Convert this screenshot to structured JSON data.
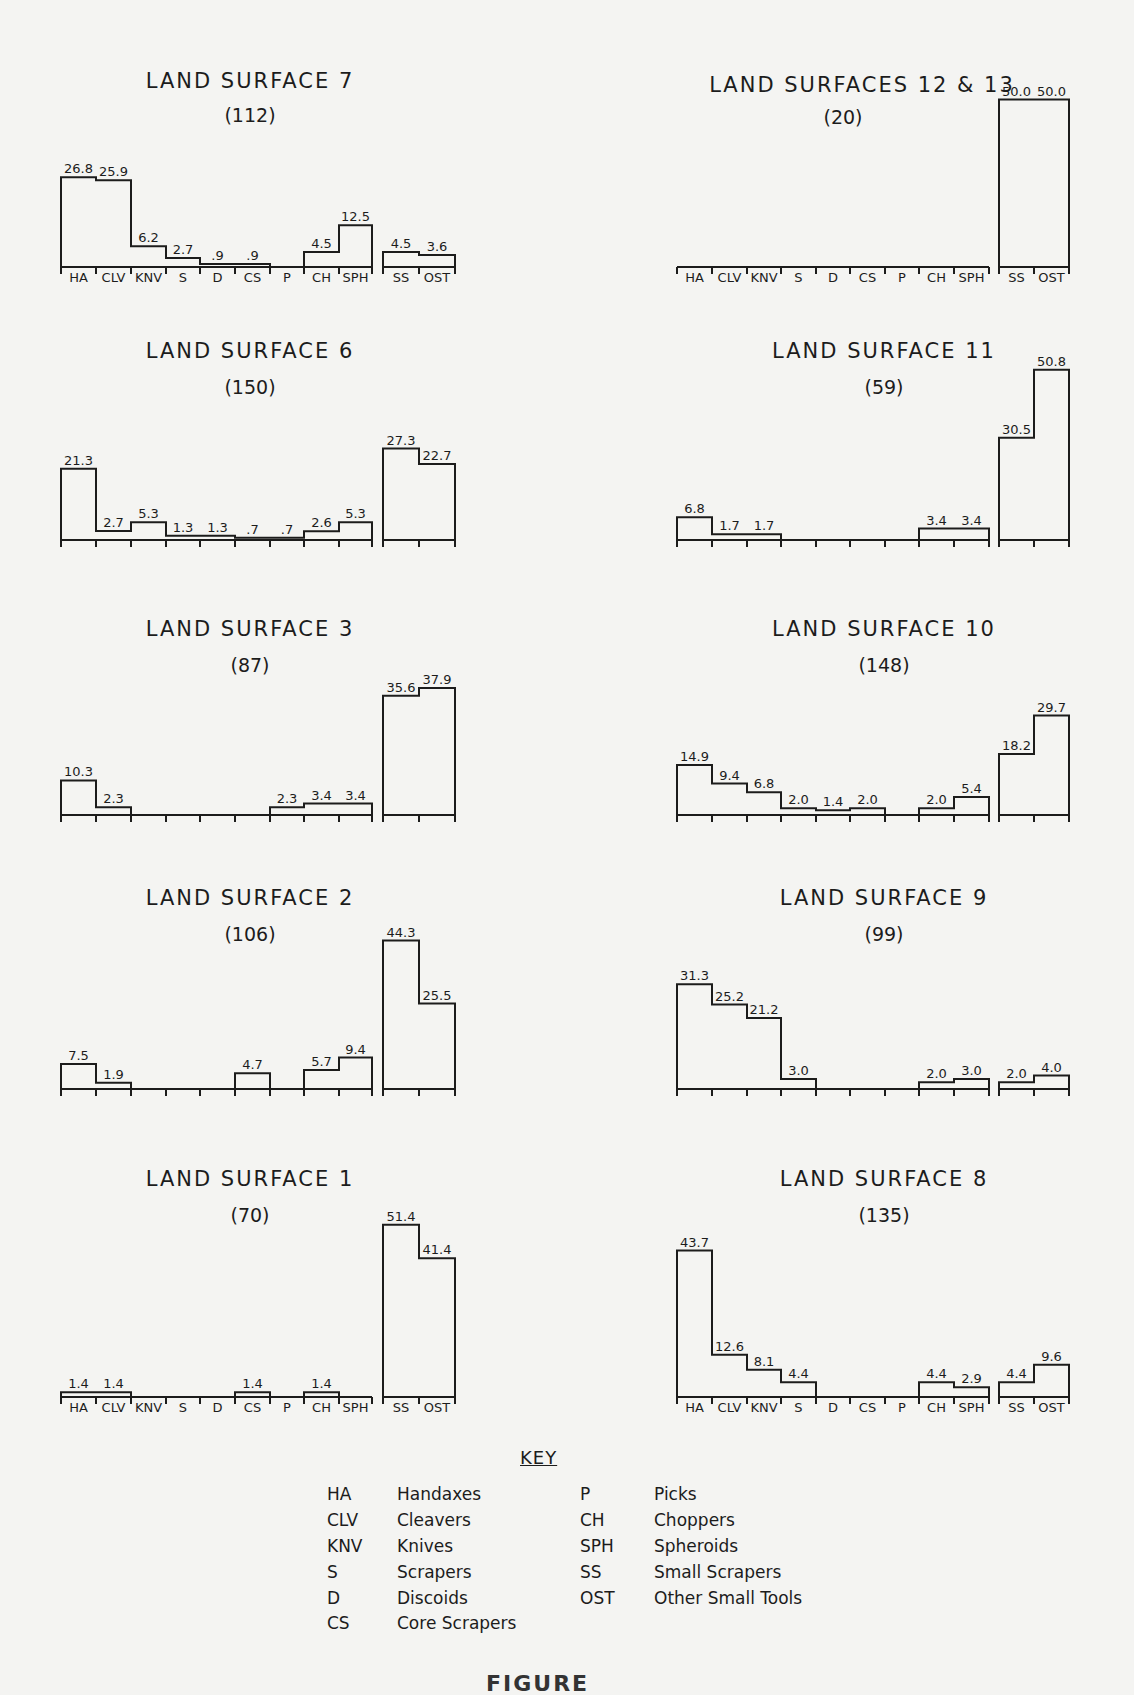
{
  "figure_caption": "FIGURE",
  "categories": [
    "HA",
    "CLV",
    "KNV",
    "S",
    "D",
    "CS",
    "P",
    "CH",
    "SPH",
    "SS",
    "OST"
  ],
  "key": {
    "title": "KEY",
    "left": [
      {
        "abbr": "HA",
        "name": "Handaxes"
      },
      {
        "abbr": "CLV",
        "name": "Cleavers"
      },
      {
        "abbr": "KNV",
        "name": "Knives"
      },
      {
        "abbr": "S",
        "name": "Scrapers"
      },
      {
        "abbr": "D",
        "name": "Discoids"
      },
      {
        "abbr": "CS",
        "name": "Core Scrapers"
      }
    ],
    "right": [
      {
        "abbr": "P",
        "name": "Picks"
      },
      {
        "abbr": "CH",
        "name": "Choppers"
      },
      {
        "abbr": "SPH",
        "name": "Spheroids"
      },
      {
        "abbr": "SS",
        "name": "Small Scrapers"
      },
      {
        "abbr": "OST",
        "name": "Other Small Tools"
      }
    ]
  },
  "chart_data": [
    {
      "type": "bar",
      "title": "LAND SURFACE 7",
      "count": "(112)",
      "column": "left",
      "show_labels": true,
      "categories": [
        "HA",
        "CLV",
        "KNV",
        "S",
        "D",
        "CS",
        "P",
        "CH",
        "SPH",
        "SS",
        "OST"
      ],
      "values": [
        26.8,
        25.9,
        6.2,
        2.7,
        0.9,
        0.9,
        0,
        4.5,
        12.5,
        4.5,
        3.6
      ],
      "value_labels": [
        "26.8",
        "25.9",
        "6.2",
        "2.7",
        ".9",
        ".9",
        "",
        "4.5",
        "12.5",
        "4.5",
        "3.6"
      ],
      "xlabel": "",
      "ylabel": "Percent",
      "grid": false
    },
    {
      "type": "bar",
      "title": "LAND SURFACE 6",
      "count": "(150)",
      "column": "left",
      "show_labels": false,
      "categories": [
        "HA",
        "CLV",
        "KNV",
        "S",
        "D",
        "CS",
        "P",
        "CH",
        "SPH",
        "SS",
        "OST"
      ],
      "values": [
        21.3,
        2.7,
        5.3,
        1.3,
        1.3,
        0.7,
        0.7,
        2.6,
        5.3,
        27.3,
        22.7
      ],
      "value_labels": [
        "21.3",
        "2.7",
        "5.3",
        "1.3",
        "1.3",
        ".7",
        ".7",
        "2.6",
        "5.3",
        "27.3",
        "22.7"
      ],
      "xlabel": "",
      "ylabel": "Percent",
      "grid": false
    },
    {
      "type": "bar",
      "title": "LAND SURFACE 3",
      "count": "(87)",
      "column": "left",
      "show_labels": false,
      "categories": [
        "HA",
        "CLV",
        "KNV",
        "S",
        "D",
        "CS",
        "P",
        "CH",
        "SPH",
        "SS",
        "OST"
      ],
      "values": [
        10.3,
        2.3,
        0,
        0,
        0,
        0,
        2.3,
        3.4,
        3.4,
        35.6,
        37.9
      ],
      "value_labels": [
        "10.3",
        "2.3",
        "",
        "",
        "",
        "",
        "2.3",
        "3.4",
        "3.4",
        "35.6",
        "37.9"
      ],
      "xlabel": "",
      "ylabel": "Percent",
      "grid": false
    },
    {
      "type": "bar",
      "title": "LAND SURFACE 2",
      "count": "(106)",
      "column": "left",
      "show_labels": false,
      "categories": [
        "HA",
        "CLV",
        "KNV",
        "S",
        "D",
        "CS",
        "P",
        "CH",
        "SPH",
        "SS",
        "OST"
      ],
      "values": [
        7.5,
        1.9,
        0,
        0,
        0,
        4.7,
        0,
        5.7,
        9.4,
        44.3,
        25.5
      ],
      "value_labels": [
        "7.5",
        "1.9",
        "",
        "",
        "",
        "4.7",
        "",
        "5.7",
        "9.4",
        "44.3",
        "25.5"
      ],
      "xlabel": "",
      "ylabel": "Percent",
      "grid": false
    },
    {
      "type": "bar",
      "title": "LAND SURFACE 1",
      "count": "(70)",
      "column": "left",
      "show_labels": true,
      "categories": [
        "HA",
        "CLV",
        "KNV",
        "S",
        "D",
        "CS",
        "P",
        "CH",
        "SPH",
        "SS",
        "OST"
      ],
      "values": [
        1.4,
        1.4,
        0,
        0,
        0,
        1.4,
        0,
        1.4,
        0,
        51.4,
        41.4
      ],
      "value_labels": [
        "1.4",
        "1.4",
        "",
        "",
        "",
        "1.4",
        "",
        "1.4",
        "",
        "51.4",
        "41.4"
      ],
      "xlabel": "",
      "ylabel": "Percent",
      "grid": false
    },
    {
      "type": "bar",
      "title": "LAND SURFACES 12 & 13",
      "count": "(20)",
      "column": "right",
      "show_labels": true,
      "categories": [
        "HA",
        "CLV",
        "KNV",
        "S",
        "D",
        "CS",
        "P",
        "CH",
        "SPH",
        "SS",
        "OST"
      ],
      "values": [
        0,
        0,
        0,
        0,
        0,
        0,
        0,
        0,
        0,
        50.0,
        50.0
      ],
      "value_labels": [
        "",
        "",
        "",
        "",
        "",
        "",
        "",
        "",
        "",
        "50.0",
        "50.0"
      ],
      "xlabel": "",
      "ylabel": "Percent",
      "grid": false
    },
    {
      "type": "bar",
      "title": "LAND SURFACE 11",
      "count": "(59)",
      "column": "right",
      "show_labels": false,
      "categories": [
        "HA",
        "CLV",
        "KNV",
        "S",
        "D",
        "CS",
        "P",
        "CH",
        "SPH",
        "SS",
        "OST"
      ],
      "values": [
        6.8,
        1.7,
        1.7,
        0,
        0,
        0,
        0,
        3.4,
        3.4,
        30.5,
        50.8
      ],
      "value_labels": [
        "6.8",
        "1.7",
        "1.7",
        "",
        "",
        "",
        "",
        "3.4",
        "3.4",
        "30.5",
        "50.8"
      ],
      "xlabel": "",
      "ylabel": "Percent",
      "grid": false
    },
    {
      "type": "bar",
      "title": "LAND SURFACE 10",
      "count": "(148)",
      "column": "right",
      "show_labels": false,
      "categories": [
        "HA",
        "CLV",
        "KNV",
        "S",
        "D",
        "CS",
        "P",
        "CH",
        "SPH",
        "SS",
        "OST"
      ],
      "values": [
        14.9,
        9.4,
        6.8,
        2.0,
        1.4,
        2.0,
        0,
        2.0,
        5.4,
        18.2,
        29.7
      ],
      "value_labels": [
        "14.9",
        "9.4",
        "6.8",
        "2.0",
        "1.4",
        "2.0",
        "",
        "2.0",
        "5.4",
        "18.2",
        "29.7"
      ],
      "xlabel": "",
      "ylabel": "Percent",
      "grid": false
    },
    {
      "type": "bar",
      "title": "LAND SURFACE 9",
      "count": "(99)",
      "column": "right",
      "show_labels": false,
      "categories": [
        "HA",
        "CLV",
        "KNV",
        "S",
        "D",
        "CS",
        "P",
        "CH",
        "SPH",
        "SS",
        "OST"
      ],
      "values": [
        31.3,
        25.2,
        21.2,
        3.0,
        0,
        0,
        0,
        2.0,
        3.0,
        2.0,
        4.0
      ],
      "value_labels": [
        "31.3",
        "25.2",
        "21.2",
        "3.0",
        "",
        "",
        "",
        "2.0",
        "3.0",
        "2.0",
        "4.0"
      ],
      "xlabel": "",
      "ylabel": "Percent",
      "grid": false
    },
    {
      "type": "bar",
      "title": "LAND SURFACE 8",
      "count": "(135)",
      "column": "right",
      "show_labels": true,
      "categories": [
        "HA",
        "CLV",
        "KNV",
        "S",
        "D",
        "CS",
        "P",
        "CH",
        "SPH",
        "SS",
        "OST"
      ],
      "values": [
        43.7,
        12.6,
        8.1,
        4.4,
        0,
        0,
        0,
        4.4,
        2.9,
        4.4,
        9.6
      ],
      "value_labels": [
        "43.7",
        "12.6",
        "8.1",
        "4.4",
        "",
        "",
        "",
        "4.4",
        "2.9",
        "4.4",
        "9.6"
      ],
      "xlabel": "",
      "ylabel": "Percent",
      "grid": false
    }
  ]
}
